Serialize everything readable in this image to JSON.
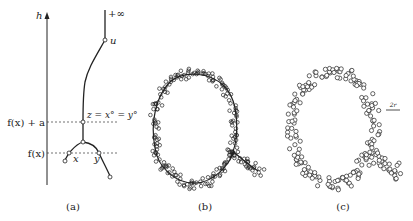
{
  "figure": {
    "panels": [
      {
        "id": "a",
        "caption": "(a)",
        "axis_label": "h",
        "top_label": "+∞",
        "node_labels": {
          "u": "u",
          "z": "z = x° = y°",
          "x": "x",
          "y": "y"
        },
        "level_labels": {
          "upper": "f(x) + a",
          "lower": "f(x)"
        }
      },
      {
        "id": "b",
        "caption": "(b)"
      },
      {
        "id": "c",
        "caption": "(c)",
        "scale_label": "2r"
      }
    ]
  },
  "colors": {
    "ink": "#222222",
    "background": "#ffffff"
  }
}
